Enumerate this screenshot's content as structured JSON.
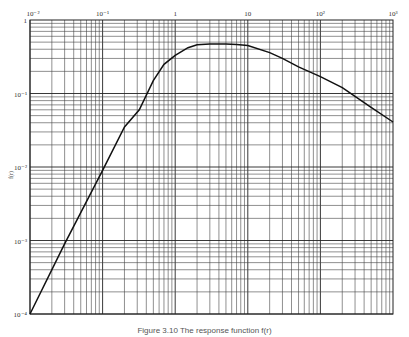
{
  "chart_data": {
    "type": "line",
    "title": "",
    "xlabel": "",
    "ylabel": "f(r)",
    "xscale": "log",
    "yscale": "log",
    "xlim": [
      0.01,
      1000
    ],
    "ylim": [
      0.0001,
      1
    ],
    "grid": true,
    "legend": null,
    "x_tick_labels": [
      "10⁻²",
      "10⁻¹",
      "1",
      "10",
      "10²",
      "10³"
    ],
    "y_tick_labels": [
      "1",
      "10⁻¹",
      "10⁻²",
      "10⁻³",
      "10⁻⁴"
    ],
    "series": [
      {
        "name": "f(r)",
        "x": [
          0.01,
          0.03,
          0.1,
          0.2,
          0.32,
          0.5,
          0.7,
          1,
          1.5,
          2,
          3,
          5,
          7,
          10,
          20,
          30,
          50,
          100,
          200,
          500,
          1000
        ],
        "y": [
          0.0001,
          0.0009,
          0.009,
          0.035,
          0.06,
          0.15,
          0.25,
          0.33,
          0.42,
          0.46,
          0.47,
          0.47,
          0.465,
          0.45,
          0.36,
          0.3,
          0.23,
          0.17,
          0.12,
          0.065,
          0.041
        ]
      }
    ]
  },
  "caption": "Figure 3.10  The response function f(r)"
}
